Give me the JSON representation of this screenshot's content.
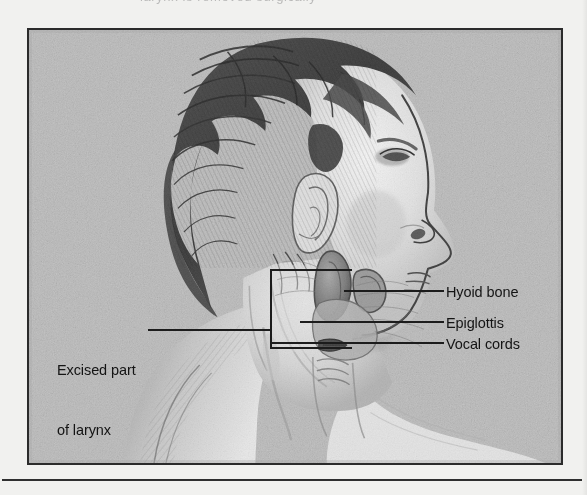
{
  "figure": {
    "kind": "anatomical-illustration",
    "style": "grayscale pencil / stipple halftone medical drawing",
    "clipped_caption_above": "larynx is removed surgically",
    "frame": {
      "border_color": "#2b2b2b",
      "background_color": "#b8b8b8"
    }
  },
  "callouts": {
    "excised": {
      "line1": "Excised part",
      "line2": "of larynx",
      "leader_from_x": 148,
      "leader_y": 330
    },
    "right": [
      {
        "id": "hyoid-bone",
        "label": "Hyoid bone",
        "leader_y": 291
      },
      {
        "id": "epiglottis",
        "label": "Epiglottis",
        "leader_y": 322
      },
      {
        "id": "vocal-cords",
        "label": "Vocal cords",
        "leader_y": 343
      }
    ]
  },
  "excision_box": {
    "left": 271,
    "top": 270,
    "right": 352,
    "bottom": 348,
    "stroke": "#1c1c1c"
  },
  "colors": {
    "ink": "#141414",
    "plate_background": "#b8b8b8",
    "page_background": "#f1f1ef",
    "rule": "#2f2f2f",
    "skin_light": "#ececec",
    "skin_mid": "#c9c9c9",
    "hair_dark": "#3a3a3a",
    "cartilage": "#7d7d7d"
  },
  "bottom_rule": {
    "present": true
  }
}
